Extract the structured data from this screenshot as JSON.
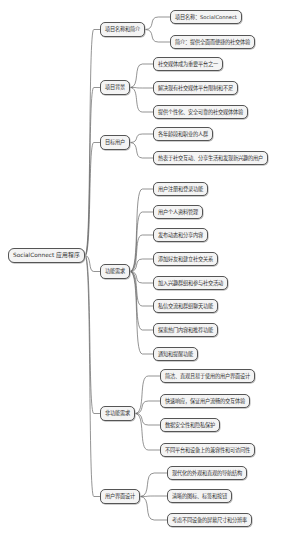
{
  "mindmap": {
    "root": {
      "label": "SocialConnect 应用程序"
    },
    "branches": [
      {
        "label": "项目名称和简介",
        "children": [
          "项目名称：SocialConnect",
          "简介：提供全面而便捷的社交体验"
        ]
      },
      {
        "label": "项目背景",
        "children": [
          "社交媒体成为重要平台之一",
          "解决现有社交媒体平台限制和不足",
          "提供个性化、安全可靠的社交媒体体验"
        ]
      },
      {
        "label": "目标用户",
        "children": [
          "各年龄段和职业的人群",
          "热衷于社交互动、分享生活和发现新兴趣的用户"
        ]
      },
      {
        "label": "功能需求",
        "children": [
          "用户注册和登录功能",
          "用户个人资料管理",
          "发布动态和分享内容",
          "添加好友和建立社交关系",
          "加入兴趣群组和参与社交活动",
          "私信交流和群组聊天功能",
          "探索热门内容和推荐功能",
          "通知和提醒功能"
        ]
      },
      {
        "label": "非功能需求",
        "children": [
          "简洁、直观且易于使用的用户界面设计",
          "快速响应，保证用户流畅的交互体验",
          "数据安全性和隐私保护",
          "不同平台和设备上的兼容性和可访问性"
        ]
      },
      {
        "label": "用户界面设计",
        "children": [
          "现代化的外观和直观的导航结构",
          "清晰的图标、标签和按钮",
          "考虑不同设备的屏幕尺寸和分辨率"
        ]
      }
    ]
  },
  "colors": {
    "node_fill": "#f4f4f4",
    "node_border": "#555555",
    "link": "#666666",
    "background": "#ffffff"
  },
  "caption": " "
}
